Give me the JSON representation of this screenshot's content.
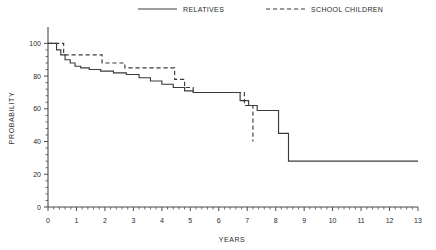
{
  "chart_data": {
    "type": "line",
    "title": "",
    "xlabel": "YEARS",
    "ylabel": "PROBABILITY",
    "xlim": [
      0,
      13
    ],
    "ylim": [
      0,
      110
    ],
    "xticks": [
      0,
      1,
      2,
      3,
      4,
      5,
      6,
      7,
      8,
      9,
      10,
      11,
      12,
      13
    ],
    "yticks": [
      0,
      20,
      40,
      60,
      80,
      100
    ],
    "xtick_labels": [
      "0",
      "1",
      "2",
      "3",
      "4",
      "5",
      "6",
      "7",
      "8",
      "9",
      "10",
      "11",
      "12",
      "13"
    ],
    "ytick_labels": [
      "0",
      "20",
      "40",
      "60",
      "80",
      "100"
    ],
    "minor_ticks_per_interval": 4,
    "grid": false,
    "legend_position": "top-center",
    "step_style": "post",
    "series": [
      {
        "name": "RELATIVES",
        "style": "solid",
        "color": "#3a3a3a",
        "x": [
          0.0,
          0.12,
          0.3,
          0.45,
          0.6,
          0.78,
          0.95,
          1.15,
          1.45,
          1.85,
          2.3,
          2.75,
          3.2,
          3.6,
          4.0,
          4.4,
          4.8,
          5.1,
          5.45,
          5.9,
          6.35,
          6.75,
          7.05,
          7.35,
          7.7,
          8.1,
          8.45,
          13.0
        ],
        "y": [
          100.0,
          100.0,
          96.0,
          93.0,
          90.0,
          88.0,
          86.0,
          85.0,
          84.0,
          83.0,
          82.0,
          81.0,
          79.0,
          77.0,
          75.0,
          73.0,
          71.0,
          70.0,
          70.0,
          70.0,
          70.0,
          65.0,
          62.0,
          59.0,
          59.0,
          45.0,
          28.0,
          28.0
        ]
      },
      {
        "name": "SCHOOL CHILDREN",
        "style": "dashed",
        "color": "#3a3a3a",
        "x": [
          0.0,
          0.25,
          0.55,
          1.0,
          1.9,
          2.3,
          2.7,
          3.1,
          3.55,
          4.0,
          4.45,
          4.8,
          5.1,
          5.45,
          6.2,
          6.9,
          7.15,
          7.2
        ],
        "y": [
          100.0,
          100.0,
          93.0,
          93.0,
          88.0,
          88.0,
          85.0,
          85.0,
          85.0,
          85.0,
          78.0,
          73.0,
          70.0,
          70.0,
          70.0,
          62.0,
          62.0,
          40.0
        ]
      }
    ]
  },
  "legend": {
    "items": [
      {
        "label": "RELATIVES",
        "style": "solid"
      },
      {
        "label": "SCHOOL CHILDREN",
        "style": "dashed"
      }
    ]
  }
}
